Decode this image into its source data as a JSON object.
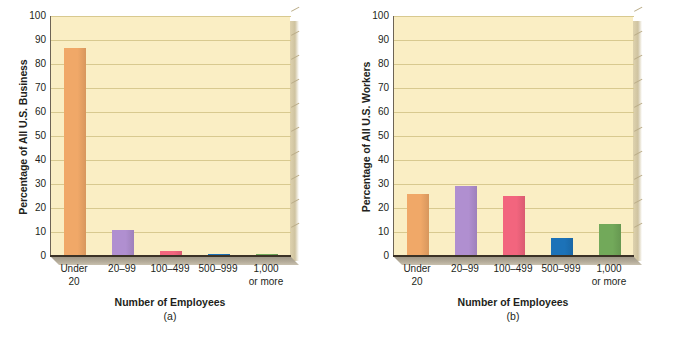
{
  "chart_data": [
    {
      "type": "bar",
      "panel": "(a)",
      "title": "",
      "xlabel": "Number of Employees",
      "ylabel": "Percentage of All U.S. Business",
      "categories": [
        "Under 20",
        "20–99",
        "100–499",
        "500–999",
        "1,000 or more"
      ],
      "category_lines": [
        [
          "Under",
          "20"
        ],
        [
          "20–99",
          ""
        ],
        [
          "100–499",
          ""
        ],
        [
          "500–999",
          ""
        ],
        [
          "1,000",
          "or more"
        ]
      ],
      "values": [
        86.5,
        11.0,
        2.0,
        0.9,
        0.8
      ],
      "colors": [
        "#f0a868",
        "#b08fd0",
        "#f2657e",
        "#1c72b8",
        "#72a95a"
      ],
      "ylim": [
        0,
        100
      ],
      "yticks": [
        0,
        10,
        20,
        30,
        40,
        50,
        60,
        70,
        80,
        90,
        100
      ],
      "grid": true,
      "legend": "none"
    },
    {
      "type": "bar",
      "panel": "(b)",
      "title": "",
      "xlabel": "Number of Employees",
      "ylabel": "Percentage of All U.S. Workers",
      "categories": [
        "Under 20",
        "20–99",
        "100–499",
        "500–999",
        "1,000 or more"
      ],
      "category_lines": [
        [
          "Under",
          "20"
        ],
        [
          "20–99",
          ""
        ],
        [
          "100–499",
          ""
        ],
        [
          "500–999",
          ""
        ],
        [
          "1,000",
          "or more"
        ]
      ],
      "values": [
        25.8,
        29.0,
        24.8,
        7.5,
        13.4
      ],
      "colors": [
        "#f0a868",
        "#b08fd0",
        "#f2657e",
        "#1c72b8",
        "#72a95a"
      ],
      "ylim": [
        0,
        100
      ],
      "yticks": [
        0,
        10,
        20,
        30,
        40,
        50,
        60,
        70,
        80,
        90,
        100
      ],
      "grid": true,
      "legend": "none"
    }
  ],
  "style": {
    "plot_background": "#faeec4",
    "gridline_color": "#d8c98f",
    "axis_color": "#3b3226",
    "floor_color": "#b3aa98",
    "text_color": "#231f20"
  }
}
